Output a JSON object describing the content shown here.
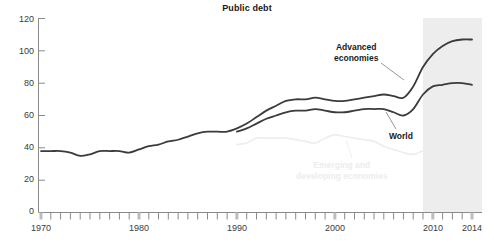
{
  "chart_data": {
    "type": "line",
    "title": "Public debt",
    "subtitle": "",
    "xlabel": "",
    "ylabel": "",
    "xlim": [
      1970,
      2014
    ],
    "ylim": [
      0,
      120
    ],
    "yticks": [
      0,
      20,
      40,
      60,
      80,
      100,
      120
    ],
    "xticks": [
      1970,
      1980,
      1990,
      2000,
      2010,
      2014
    ],
    "xtick_minor_interval": 1,
    "grid": false,
    "legend_position": "inline-annotations",
    "shaded_region": {
      "label": "projection",
      "start": 2009,
      "end": 2014,
      "color": "#ededed"
    },
    "series": [
      {
        "name": "Advanced economies",
        "color": "#3b3b3b",
        "x": [
          1970,
          1971,
          1972,
          1973,
          1974,
          1975,
          1976,
          1977,
          1978,
          1979,
          1980,
          1981,
          1982,
          1983,
          1984,
          1985,
          1986,
          1987,
          1988,
          1989,
          1990,
          1991,
          1992,
          1993,
          1994,
          1995,
          1996,
          1997,
          1998,
          1999,
          2000,
          2001,
          2002,
          2003,
          2004,
          2005,
          2006,
          2007,
          2008,
          2009,
          2010,
          2011,
          2012,
          2013,
          2014
        ],
        "values": [
          38,
          38,
          38,
          37,
          35,
          36,
          38,
          38,
          38,
          37,
          39,
          41,
          42,
          44,
          45,
          47,
          49,
          50,
          50,
          50,
          52,
          55,
          59,
          63,
          66,
          69,
          70,
          70,
          71,
          70,
          69,
          69,
          70,
          71,
          72,
          73,
          72,
          71,
          78,
          90,
          98,
          103,
          106,
          107,
          107
        ]
      },
      {
        "name": "World",
        "color": "#3b3b3b",
        "x": [
          1990,
          1991,
          1992,
          1993,
          1994,
          1995,
          1996,
          1997,
          1998,
          1999,
          2000,
          2001,
          2002,
          2003,
          2004,
          2005,
          2006,
          2007,
          2008,
          2009,
          2010,
          2011,
          2012,
          2013,
          2014
        ],
        "values": [
          50,
          52,
          55,
          58,
          60,
          62,
          63,
          63,
          64,
          63,
          62,
          62,
          63,
          64,
          64,
          64,
          62,
          60,
          64,
          73,
          78,
          79,
          80,
          80,
          79
        ]
      },
      {
        "name": "Emerging and developing economies",
        "color": "#ededed",
        "x": [
          1990,
          1991,
          1992,
          1993,
          1994,
          1995,
          1996,
          1997,
          1998,
          1999,
          2000,
          2001,
          2002,
          2003,
          2004,
          2005,
          2006,
          2007,
          2008,
          2009,
          2010,
          2011,
          2012,
          2013,
          2014
        ],
        "values": [
          42,
          43,
          46,
          46,
          46,
          46,
          45,
          44,
          43,
          46,
          48,
          47,
          46,
          45,
          44,
          41,
          39,
          37,
          36,
          38,
          38,
          37,
          36,
          35,
          34
        ]
      }
    ],
    "annotations": [
      {
        "text_line1": "Advanced",
        "text_line2": "economies",
        "style": "bold-dark"
      },
      {
        "text_line1": "World",
        "text_line2": "",
        "style": "bold-dark"
      },
      {
        "text_line1": "Emerging and",
        "text_line2": "developing economies",
        "style": "faded"
      }
    ]
  },
  "axis": {
    "ytick_labels": [
      "120",
      "100",
      "80",
      "60",
      "40",
      "20",
      "0"
    ],
    "xtick_labels": [
      "1970",
      "1980",
      "1990",
      "2000",
      "2010",
      "2014"
    ]
  },
  "annotations": {
    "advanced_line1": "Advanced",
    "advanced_line2": "economies",
    "world": "World",
    "emerging_line1": "Emerging and",
    "emerging_line2": "developing economies"
  },
  "colors": {
    "dark_line": "#3b3b3b",
    "faded_line": "#ededed",
    "axis": "#8a8a8a",
    "shade": "#ededed",
    "text": "#1a1a1a"
  }
}
